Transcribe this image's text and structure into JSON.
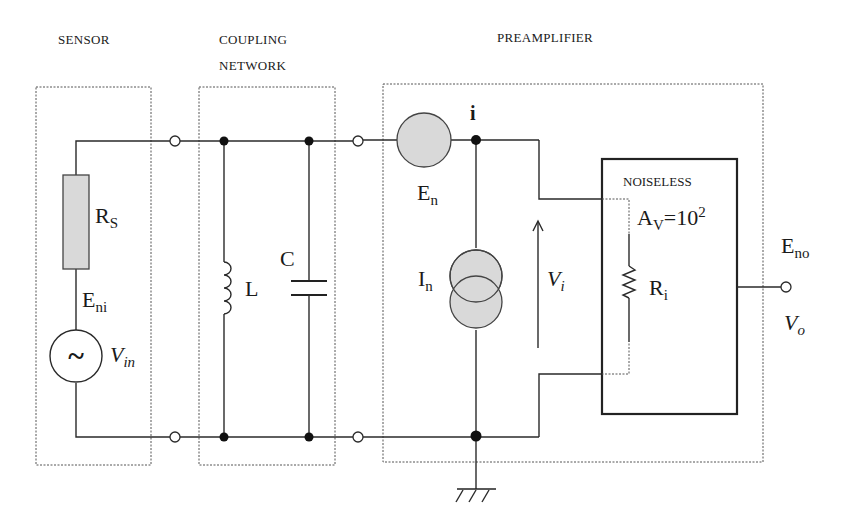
{
  "diagram": {
    "type": "circuit-schematic",
    "sections": [
      {
        "id": "sensor",
        "label": "SENSOR"
      },
      {
        "id": "coupling",
        "label_line1": "COUPLING",
        "label_line2": "NETWORK"
      },
      {
        "id": "preamplifier",
        "label": "PREAMPLIFIER"
      }
    ],
    "components": {
      "source_resistance": {
        "symbol": "R",
        "subscript": "S"
      },
      "input_noise": {
        "symbol": "E",
        "subscript": "ni"
      },
      "signal_source": {
        "symbol": "V",
        "subscript": "in",
        "glyph": "~"
      },
      "inductor": {
        "symbol": "L"
      },
      "capacitor": {
        "symbol": "C"
      },
      "voltage_noise": {
        "symbol": "E",
        "subscript": "n"
      },
      "current_noise": {
        "symbol": "I",
        "subscript": "n"
      },
      "node_label": "i",
      "input_voltage": {
        "symbol": "V",
        "subscript": "i"
      },
      "amplifier": {
        "label": "NOISELESS",
        "gain_symbol": "A",
        "gain_subscript": "V",
        "gain_eq": "=10",
        "gain_exp": "2"
      },
      "input_resistance": {
        "symbol": "R",
        "subscript": "i"
      },
      "output_noise": {
        "symbol": "E",
        "subscript": "no"
      },
      "output_voltage": {
        "symbol": "V",
        "subscript": "o"
      }
    },
    "colors": {
      "wire": "#2a2a2a",
      "noise_source_fill": "#d9d9d9",
      "background": "#ffffff"
    }
  }
}
